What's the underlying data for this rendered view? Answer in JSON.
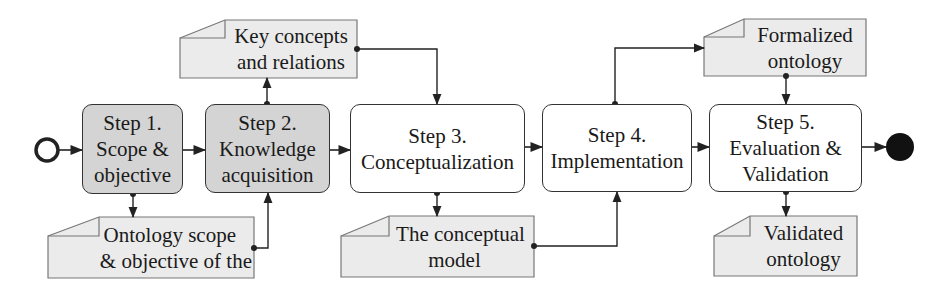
{
  "diagram": {
    "colors": {
      "stroke": "#333333",
      "shaded_fill": "#d4d4d4",
      "doc_fill": "#ebebeb",
      "plain_fill": "#ffffff"
    },
    "start_node": {
      "type": "start-event",
      "shape": "hollow-circle"
    },
    "end_node": {
      "type": "end-event",
      "shape": "filled-circle"
    },
    "steps": [
      {
        "id": "step1",
        "lines": [
          "Step 1.",
          "Scope &",
          "objective"
        ],
        "shaded": true
      },
      {
        "id": "step2",
        "lines": [
          "Step 2.",
          "Knowledge",
          "acquisition"
        ],
        "shaded": true
      },
      {
        "id": "step3",
        "lines": [
          "Step 3.",
          "Conceptualization"
        ],
        "shaded": false
      },
      {
        "id": "step4",
        "lines": [
          "Step 4.",
          "Implementation"
        ],
        "shaded": false
      },
      {
        "id": "step5",
        "lines": [
          "Step 5.",
          "Evaluation &",
          "Validation"
        ],
        "shaded": false
      }
    ],
    "artifacts": [
      {
        "id": "doc-scope",
        "lines": [
          "Ontology scope",
          "& objective of the"
        ],
        "from": "step1",
        "to": "step2"
      },
      {
        "id": "doc-concepts",
        "lines": [
          "Key concepts",
          "and relations"
        ],
        "from": "step2",
        "to": "step3"
      },
      {
        "id": "doc-conceptual-model",
        "lines": [
          "The conceptual",
          "model"
        ],
        "from": "step3",
        "to": "step4"
      },
      {
        "id": "doc-formalized",
        "lines": [
          "Formalized",
          "ontology"
        ],
        "from": "step4",
        "to": "step5"
      },
      {
        "id": "doc-validated",
        "lines": [
          "Validated",
          "ontology"
        ],
        "from": "step5",
        "to": null
      }
    ]
  }
}
